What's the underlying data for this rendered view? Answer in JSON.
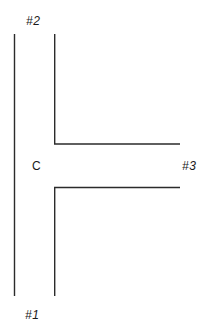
{
  "diagram": {
    "background_color": "#ffffff",
    "line_color": "#2b2b2b",
    "line_width": 1.4,
    "labels": {
      "port_1": "#1",
      "port_2": "#2",
      "port_3": "#3",
      "center": "C"
    },
    "geometry": {
      "left_wall": {
        "x": 14.5,
        "y_top": 34,
        "y_bottom": 296
      },
      "upper_inner_wall": {
        "x": 54.5,
        "y_top": 34,
        "y_corner": 144,
        "x_end": 180
      },
      "lower_inner_wall": {
        "x": 54.5,
        "y_corner": 187,
        "y_bottom": 296,
        "x_end": 180
      },
      "channel_gap": {
        "y_top": 144,
        "y_bottom": 187
      }
    }
  }
}
